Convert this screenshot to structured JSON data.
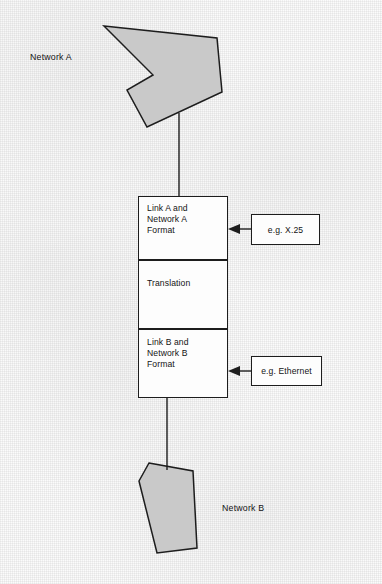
{
  "diagram": {
    "networks": [
      {
        "id": "network-a",
        "label": "Network A",
        "x": 30,
        "y": 52
      },
      {
        "id": "network-b",
        "label": "Network B",
        "x": 222,
        "y": 503
      }
    ],
    "gateway": {
      "x": 138,
      "y": 196,
      "width": 90,
      "height": 202,
      "segments": [
        {
          "id": "link-a-segment",
          "label": "Link A and\nNetwork A\nFormat",
          "height": 64
        },
        {
          "id": "translation-segment",
          "label": "Translation",
          "height": 69
        },
        {
          "id": "link-b-segment",
          "label": "Link B and\nNetwork B\nFormat",
          "height": 69
        }
      ]
    },
    "callouts": [
      {
        "id": "callout-x25",
        "label": "e.g. X.25",
        "x": 251,
        "y": 214,
        "width": 69,
        "height": 31,
        "arrow_y": 229
      },
      {
        "id": "callout-ethernet",
        "label": "e.g. Ethernet",
        "x": 251,
        "y": 356,
        "width": 71,
        "height": 30,
        "arrow_y": 371
      }
    ],
    "connectors": [
      {
        "id": "connector-network-a",
        "x": 179,
        "y1": 127,
        "y2": 196
      },
      {
        "id": "connector-network-b",
        "x": 167,
        "y1": 398,
        "y2": 466
      }
    ],
    "shapes": {
      "network_a_polygon": "104,26 217,38 222,92 147,127 127,90 153,75",
      "network_b_polygon": "149,463 193,471 197,548 157,553 139,481",
      "fill_color": "#c9c9c9",
      "stroke_color": "#1d1d1d"
    }
  }
}
